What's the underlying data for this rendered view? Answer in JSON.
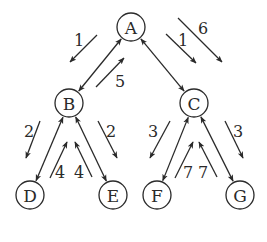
{
  "diagram": {
    "type": "tree-message-passing",
    "nodes": [
      {
        "id": "A",
        "label": "A",
        "x": 131,
        "y": 27
      },
      {
        "id": "B",
        "label": "B",
        "x": 69,
        "y": 103
      },
      {
        "id": "C",
        "label": "C",
        "x": 194,
        "y": 103
      },
      {
        "id": "D",
        "label": "D",
        "x": 30,
        "y": 195
      },
      {
        "id": "E",
        "label": "E",
        "x": 113,
        "y": 195
      },
      {
        "id": "F",
        "label": "F",
        "x": 157,
        "y": 195
      },
      {
        "id": "G",
        "label": "G",
        "x": 240,
        "y": 195
      }
    ],
    "edges": [
      {
        "from": "A",
        "to": "B",
        "bidirectional": true
      },
      {
        "from": "A",
        "to": "C",
        "bidirectional": true
      },
      {
        "from": "B",
        "to": "D",
        "bidirectional": true
      },
      {
        "from": "B",
        "to": "E",
        "bidirectional": true
      },
      {
        "from": "C",
        "to": "F",
        "bidirectional": true
      },
      {
        "from": "C",
        "to": "G",
        "bidirectional": true
      }
    ],
    "messages": [
      {
        "label": "1",
        "direction": "A→B",
        "x1": 97,
        "y1": 35,
        "x2": 70,
        "y2": 62,
        "lx": 79,
        "ly": 40
      },
      {
        "label": "5",
        "direction": "B→A",
        "x1": 96,
        "y1": 87,
        "x2": 124,
        "y2": 58,
        "lx": 120,
        "ly": 81
      },
      {
        "label": "1",
        "direction": "A→C",
        "x1": 166,
        "y1": 34,
        "x2": 196,
        "y2": 63,
        "lx": 183,
        "ly": 40
      },
      {
        "label": "6",
        "direction": "A→C",
        "x1": 178,
        "y1": 18,
        "x2": 222,
        "y2": 62,
        "lx": 203,
        "ly": 28
      },
      {
        "label": "2",
        "direction": "B→D",
        "x1": 40,
        "y1": 121,
        "x2": 26,
        "y2": 158,
        "lx": 29,
        "ly": 131
      },
      {
        "label": "4",
        "direction": "D→B",
        "x1": 50,
        "y1": 178,
        "x2": 67,
        "y2": 142,
        "lx": 60,
        "ly": 172
      },
      {
        "label": "4",
        "direction": "E→B",
        "x1": 92,
        "y1": 177,
        "x2": 75,
        "y2": 142,
        "lx": 79,
        "ly": 172
      },
      {
        "label": "2",
        "direction": "B→E",
        "x1": 98,
        "y1": 121,
        "x2": 117,
        "y2": 158,
        "lx": 111,
        "ly": 131
      },
      {
        "label": "3",
        "direction": "C→F",
        "x1": 170,
        "y1": 121,
        "x2": 150,
        "y2": 158,
        "lx": 153,
        "ly": 131
      },
      {
        "label": "7",
        "direction": "F→C",
        "x1": 175,
        "y1": 178,
        "x2": 193,
        "y2": 142,
        "lx": 188,
        "ly": 172
      },
      {
        "label": "7",
        "direction": "G→C",
        "x1": 217,
        "y1": 177,
        "x2": 199,
        "y2": 142,
        "lx": 203,
        "ly": 172
      },
      {
        "label": "3",
        "direction": "C→G",
        "x1": 225,
        "y1": 121,
        "x2": 243,
        "y2": 158,
        "lx": 238,
        "ly": 131
      }
    ],
    "colors": {
      "stroke": "#2a2a2a",
      "background": "#ffffff"
    },
    "node_radius": 14
  }
}
